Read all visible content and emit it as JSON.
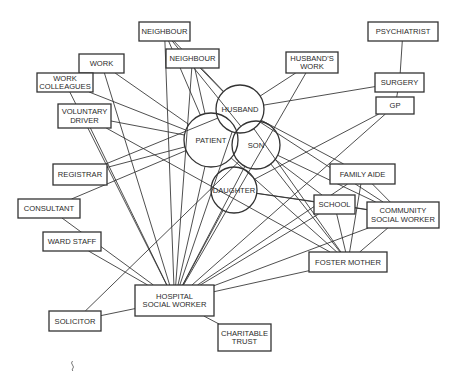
{
  "diagram": {
    "title": "",
    "colors": {
      "stroke": "#333333",
      "text": "#2a2a2a",
      "background": "#ffffff"
    },
    "nodes": [
      {
        "id": "neighbour1",
        "shape": "box",
        "lines": [
          "NEIGHBOUR"
        ]
      },
      {
        "id": "neighbour2",
        "shape": "box",
        "lines": [
          "NEIGHBOUR"
        ]
      },
      {
        "id": "work",
        "shape": "box",
        "lines": [
          "WORK"
        ]
      },
      {
        "id": "work_colleagues",
        "shape": "box",
        "lines": [
          "WORK",
          "COLLEAGUES"
        ]
      },
      {
        "id": "voluntary_driver",
        "shape": "box",
        "lines": [
          "VOLUNTARY",
          "DRIVER"
        ]
      },
      {
        "id": "registrar",
        "shape": "box",
        "lines": [
          "REGISTRAR"
        ]
      },
      {
        "id": "consultant",
        "shape": "box",
        "lines": [
          "CONSULTANT"
        ]
      },
      {
        "id": "ward_staff",
        "shape": "box",
        "lines": [
          "WARD STAFF"
        ]
      },
      {
        "id": "hospital_sw",
        "shape": "box",
        "lines": [
          "HOSPITAL",
          "SOCIAL WORKER"
        ]
      },
      {
        "id": "solicitor",
        "shape": "box",
        "lines": [
          "SOLICITOR"
        ]
      },
      {
        "id": "charitable_trust",
        "shape": "box",
        "lines": [
          "CHARITABLE",
          "TRUST"
        ]
      },
      {
        "id": "husbands_work",
        "shape": "box",
        "lines": [
          "HUSBAND'S",
          "WORK"
        ]
      },
      {
        "id": "psychiatrist",
        "shape": "box",
        "lines": [
          "PSYCHIATRIST"
        ]
      },
      {
        "id": "surgery",
        "shape": "box",
        "lines": [
          "SURGERY"
        ]
      },
      {
        "id": "gp",
        "shape": "box",
        "lines": [
          "GP"
        ]
      },
      {
        "id": "family_aide",
        "shape": "box",
        "lines": [
          "FAMILY AIDE"
        ]
      },
      {
        "id": "school",
        "shape": "box",
        "lines": [
          "SCHOOL"
        ]
      },
      {
        "id": "community_sw",
        "shape": "box",
        "lines": [
          "COMMUNITY",
          "SOCIAL WORKER"
        ]
      },
      {
        "id": "foster_mother",
        "shape": "box",
        "lines": [
          "FOSTER MOTHER"
        ]
      },
      {
        "id": "husband",
        "shape": "circle",
        "lines": [
          "HUSBAND"
        ]
      },
      {
        "id": "patient",
        "shape": "circle",
        "lines": [
          "PATIENT"
        ]
      },
      {
        "id": "son",
        "shape": "circle",
        "lines": [
          "SON"
        ]
      },
      {
        "id": "daughter",
        "shape": "circle",
        "lines": [
          "DAUGHTER"
        ]
      }
    ],
    "edges": [
      [
        "neighbour1",
        "hospital_sw"
      ],
      [
        "neighbour1",
        "husband"
      ],
      [
        "neighbour1",
        "son"
      ],
      [
        "neighbour1",
        "patient"
      ],
      [
        "neighbour2",
        "hospital_sw"
      ],
      [
        "neighbour2",
        "husband"
      ],
      [
        "neighbour2",
        "patient"
      ],
      [
        "work",
        "patient"
      ],
      [
        "work",
        "hospital_sw"
      ],
      [
        "work_colleagues",
        "patient"
      ],
      [
        "work_colleagues",
        "hospital_sw"
      ],
      [
        "voluntary_driver",
        "patient"
      ],
      [
        "voluntary_driver",
        "hospital_sw"
      ],
      [
        "voluntary_driver",
        "foster_mother"
      ],
      [
        "registrar",
        "husband"
      ],
      [
        "registrar",
        "patient"
      ],
      [
        "consultant",
        "patient"
      ],
      [
        "consultant",
        "hospital_sw"
      ],
      [
        "ward_staff",
        "hospital_sw"
      ],
      [
        "solicitor",
        "hospital_sw"
      ],
      [
        "solicitor",
        "son"
      ],
      [
        "hospital_sw",
        "charitable_trust"
      ],
      [
        "hospital_sw",
        "husband"
      ],
      [
        "hospital_sw",
        "patient"
      ],
      [
        "hospital_sw",
        "son"
      ],
      [
        "hospital_sw",
        "daughter"
      ],
      [
        "hospital_sw",
        "family_aide"
      ],
      [
        "hospital_sw",
        "school"
      ],
      [
        "hospital_sw",
        "community_sw"
      ],
      [
        "hospital_sw",
        "foster_mother"
      ],
      [
        "hospital_sw",
        "gp"
      ],
      [
        "hospital_sw",
        "husbands_work"
      ],
      [
        "husbands_work",
        "husband"
      ],
      [
        "psychiatrist",
        "surgery"
      ],
      [
        "surgery",
        "husband"
      ],
      [
        "surgery",
        "gp"
      ],
      [
        "gp",
        "daughter"
      ],
      [
        "husband",
        "family_aide"
      ],
      [
        "husband",
        "foster_mother"
      ],
      [
        "husband",
        "community_sw"
      ],
      [
        "son",
        "foster_mother"
      ],
      [
        "son",
        "community_sw"
      ],
      [
        "son",
        "school"
      ],
      [
        "daughter",
        "community_sw"
      ],
      [
        "daughter",
        "school"
      ],
      [
        "family_aide",
        "community_sw"
      ],
      [
        "family_aide",
        "foster_mother"
      ],
      [
        "school",
        "community_sw"
      ],
      [
        "school",
        "foster_mother"
      ],
      [
        "community_sw",
        "foster_mother"
      ],
      [
        "patient",
        "foster_mother"
      ]
    ]
  }
}
